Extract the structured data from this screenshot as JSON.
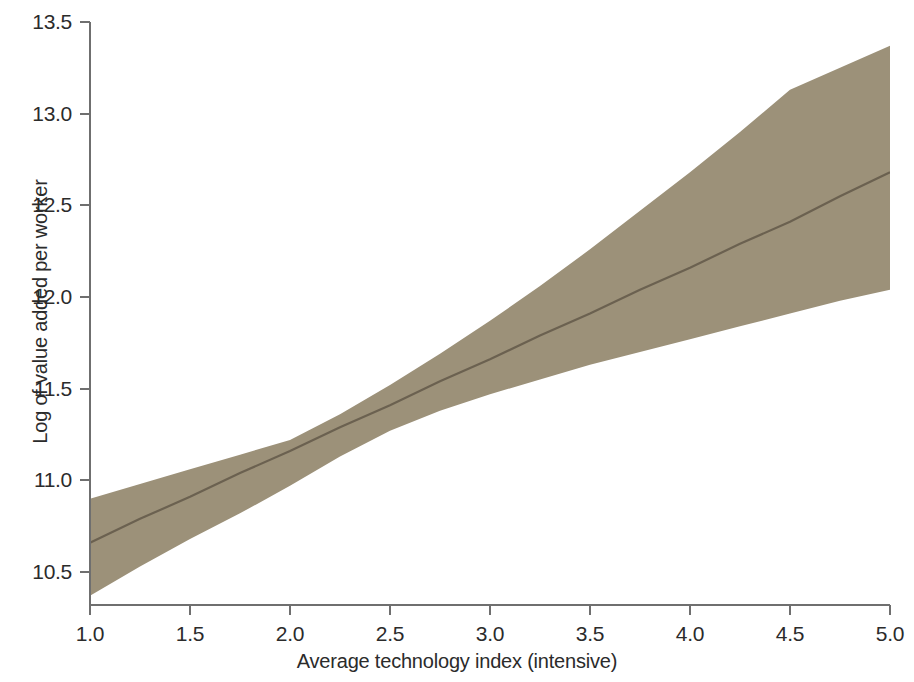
{
  "chart_data": {
    "type": "area",
    "title": "",
    "subtitle": "",
    "xlabel": "Average technology index (intensive)",
    "ylabel": "Log of value added per worker",
    "xlim": [
      1.0,
      5.0
    ],
    "ylim": [
      10.35,
      13.5
    ],
    "grid": false,
    "legend": null,
    "xticks": [
      "1.0",
      "1.5",
      "2.0",
      "2.5",
      "3.0",
      "3.5",
      "4.0",
      "4.5",
      "5.0"
    ],
    "xtick_values": [
      1.0,
      1.5,
      2.0,
      2.5,
      3.0,
      3.5,
      4.0,
      4.5,
      5.0
    ],
    "yticks": [
      "10.5",
      "11.0",
      "11.5",
      "12.0",
      "12.5",
      "13.0",
      "13.5"
    ],
    "ytick_values": [
      10.5,
      11.0,
      11.5,
      12.0,
      12.5,
      13.0,
      13.5
    ],
    "x": [
      1.0,
      1.25,
      1.5,
      1.75,
      2.0,
      2.25,
      2.5,
      2.75,
      3.0,
      3.25,
      3.5,
      3.75,
      4.0,
      4.25,
      4.5,
      4.75,
      5.0
    ],
    "series": [
      {
        "name": "fit",
        "kind": "line",
        "color": "#6b6150",
        "values": [
          10.66,
          10.79,
          10.91,
          11.04,
          11.16,
          11.29,
          11.41,
          11.54,
          11.66,
          11.79,
          11.91,
          12.04,
          12.16,
          12.29,
          12.41,
          12.55,
          12.68
        ]
      },
      {
        "name": "confidence_interval_upper",
        "kind": "band-bound",
        "color": "#9c9179",
        "values": [
          10.9,
          10.98,
          11.06,
          11.14,
          11.22,
          11.36,
          11.52,
          11.69,
          11.87,
          12.06,
          12.26,
          12.47,
          12.68,
          12.9,
          13.13,
          13.25,
          13.37
        ]
      },
      {
        "name": "confidence_interval_lower",
        "kind": "band-bound",
        "color": "#9c9179",
        "values": [
          10.37,
          10.53,
          10.68,
          10.82,
          10.97,
          11.13,
          11.27,
          11.38,
          11.47,
          11.55,
          11.63,
          11.7,
          11.77,
          11.84,
          11.91,
          11.98,
          12.04
        ]
      }
    ],
    "band_fill_color": "#9c9179",
    "line_color": "#6b6150",
    "axis_color": "#6f6f6f",
    "background_color": "#ffffff"
  },
  "axes": {
    "x_axis_label": "Average technology index (intensive)",
    "y_axis_label": "Log of value added per worker"
  }
}
